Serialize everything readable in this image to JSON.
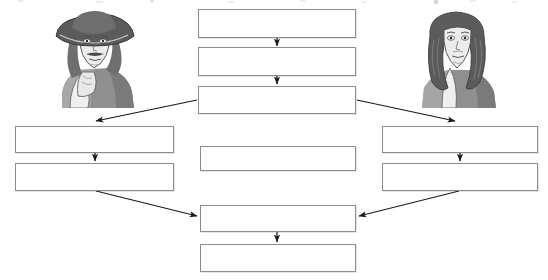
{
  "diagram": {
    "type": "flowchart",
    "title": "",
    "background_color": "#ffffff",
    "box_border_color": "#8c8c8c",
    "arrow_color": "#1a1a1a",
    "nodes": [
      {
        "id": "center-1",
        "label": "",
        "column": "center",
        "x": 198,
        "y": 9,
        "w": 158,
        "h": 29
      },
      {
        "id": "center-2",
        "label": "",
        "column": "center",
        "x": 198,
        "y": 47,
        "w": 158,
        "h": 29
      },
      {
        "id": "center-3",
        "label": "",
        "column": "center",
        "x": 198,
        "y": 86,
        "w": 158,
        "h": 28
      },
      {
        "id": "left-1",
        "label": "",
        "column": "left",
        "x": 15,
        "y": 126,
        "w": 159,
        "h": 27
      },
      {
        "id": "left-2",
        "label": "",
        "column": "left",
        "x": 15,
        "y": 163,
        "w": 159,
        "h": 28
      },
      {
        "id": "middle-isolated",
        "label": "",
        "column": "center",
        "x": 200,
        "y": 146,
        "w": 156,
        "h": 25
      },
      {
        "id": "right-1",
        "label": "",
        "column": "right",
        "x": 382,
        "y": 126,
        "w": 156,
        "h": 27
      },
      {
        "id": "right-2",
        "label": "",
        "column": "right",
        "x": 382,
        "y": 163,
        "w": 156,
        "h": 28
      },
      {
        "id": "bottom-1",
        "label": "",
        "column": "center",
        "x": 200,
        "y": 205,
        "w": 156,
        "h": 27
      },
      {
        "id": "bottom-2",
        "label": "",
        "column": "center",
        "x": 200,
        "y": 244,
        "w": 156,
        "h": 28
      }
    ],
    "connectors": [
      {
        "id": "arrow-center1-center2",
        "from": "center-1",
        "to": "center-2",
        "style": "vertical-down"
      },
      {
        "id": "arrow-center2-center3",
        "from": "center-2",
        "to": "center-3",
        "style": "vertical-down"
      },
      {
        "id": "arrow-center3-left1",
        "from": "center-3",
        "to": "left-1",
        "style": "diagonal-down-left"
      },
      {
        "id": "arrow-center3-right1",
        "from": "center-3",
        "to": "right-1",
        "style": "diagonal-down-right"
      },
      {
        "id": "arrow-left1-left2",
        "from": "left-1",
        "to": "left-2",
        "style": "vertical-down"
      },
      {
        "id": "arrow-right1-right2",
        "from": "right-1",
        "to": "right-2",
        "style": "vertical-down"
      },
      {
        "id": "arrow-left2-bottom1",
        "from": "left-2",
        "to": "bottom-1",
        "style": "diagonal-down-right"
      },
      {
        "id": "arrow-right2-bottom1",
        "from": "right-2",
        "to": "bottom-1",
        "style": "diagonal-down-left"
      },
      {
        "id": "arrow-bottom1-bottom2",
        "from": "bottom-1",
        "to": "bottom-2",
        "style": "vertical-down"
      }
    ],
    "illustrations": [
      {
        "id": "portrait-left",
        "name": "portrait-scientist-left",
        "description": "Engraved portrait of a man in a wide brimmed hat with long hair, resting his chin on his hand",
        "x": 42,
        "y": 6,
        "w": 104,
        "h": 102,
        "tone_dark": "#5b5b5b",
        "tone_mid": "#8f8f8f",
        "tone_light": "#d6d6d6"
      },
      {
        "id": "portrait-right",
        "name": "portrait-scientist-right",
        "description": "Engraved portrait of a man wearing a long flowing wig, shown from the chest up",
        "x": 408,
        "y": 6,
        "w": 100,
        "h": 102,
        "tone_dark": "#5b5b5b",
        "tone_mid": "#8f8f8f",
        "tone_light": "#d6d6d6"
      }
    ]
  }
}
